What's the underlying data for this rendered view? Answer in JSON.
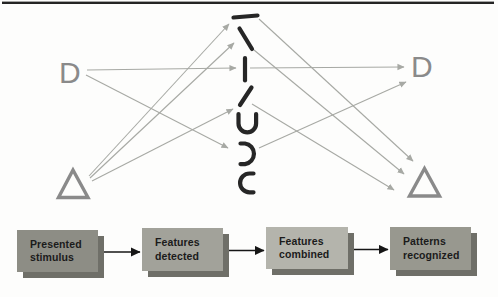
{
  "colors": {
    "background": "#fdfdfc",
    "stimulus_gray": "#8a8a8a",
    "feature_black": "#262626",
    "arrow_gray": "#a7a9a4",
    "connector_black": "#161616",
    "top_rule": "#242424",
    "shadow_gray": "#6f6f68",
    "text_dark": "#1b1b1b"
  },
  "network": {
    "left_stimulus_label": "D",
    "right_pattern_label": "D",
    "features": [
      "horizontal-line",
      "diagonal-backslash",
      "vertical-line",
      "diagonal-slash",
      "curve-open-top",
      "curve-open-left",
      "curve-open-right"
    ],
    "connections": [
      "stimulus-D -> vertical-line",
      "stimulus-D -> curve-open-left",
      "stimulus-triangle -> horizontal-line",
      "stimulus-triangle -> diagonal-backslash",
      "stimulus-triangle -> diagonal-slash",
      "vertical-line -> pattern-D",
      "curve-open-left -> pattern-D",
      "horizontal-line -> pattern-triangle",
      "diagonal-backslash -> pattern-triangle",
      "diagonal-slash -> pattern-triangle"
    ]
  },
  "flowchart": {
    "boxes": [
      {
        "label": "Presented stimulus",
        "fill": "#8d8d85"
      },
      {
        "label": "Features detected",
        "fill": "#a2a29a"
      },
      {
        "label": "Features combined",
        "fill": "#b4b4ac"
      },
      {
        "label": "Patterns recognized",
        "fill": "#98988f"
      }
    ]
  }
}
